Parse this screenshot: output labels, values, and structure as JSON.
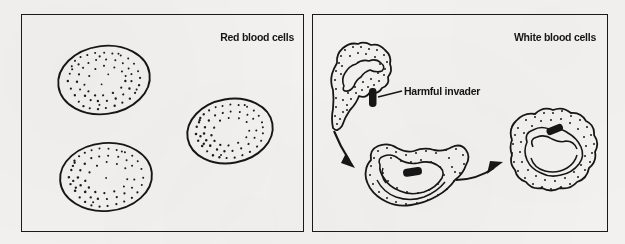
{
  "figure": {
    "type": "diagram",
    "background_color": "#f2f1ef",
    "ink_color": "#161616"
  },
  "panels": [
    {
      "id": "red",
      "title": "Red blood cells",
      "title_position": "top-right",
      "cells": [
        {
          "name": "red-blood-cell",
          "cx": 104,
          "cy": 80,
          "rx": 46,
          "ry": 34,
          "rotation": -8
        },
        {
          "name": "red-blood-cell",
          "cx": 230,
          "cy": 131,
          "rx": 43,
          "ry": 32,
          "rotation": -10
        },
        {
          "name": "red-blood-cell",
          "cx": 106,
          "cy": 177,
          "rx": 46,
          "ry": 34,
          "rotation": -5
        }
      ]
    },
    {
      "id": "white",
      "title": "White blood cells",
      "title_position": "top-right",
      "cells": [
        {
          "name": "white-blood-cell-approaching",
          "stage": 1,
          "cx": 364,
          "cy": 87
        },
        {
          "name": "white-blood-cell-engulfing",
          "stage": 2,
          "cx": 415,
          "cy": 177
        },
        {
          "name": "white-blood-cell-digesting",
          "stage": 3,
          "cx": 545,
          "cy": 150
        }
      ],
      "invaders": [
        {
          "name": "harmful-invader-free",
          "x": 372,
          "y": 97
        },
        {
          "name": "harmful-invader-engulfed",
          "x": 411,
          "y": 172
        },
        {
          "name": "harmful-invader-digested",
          "x": 554,
          "y": 129
        }
      ],
      "arrows": [
        {
          "name": "arrow-stage1-to-stage2",
          "from": [
            340,
            129
          ],
          "to": [
            359,
            163
          ]
        },
        {
          "name": "arrow-stage2-to-stage3",
          "from": [
            458,
            178
          ],
          "to": [
            508,
            163
          ]
        }
      ],
      "callout": {
        "label": "Harmful invader",
        "leader_from": [
          402,
          92
        ],
        "leader_to": [
          378,
          97
        ]
      }
    }
  ]
}
